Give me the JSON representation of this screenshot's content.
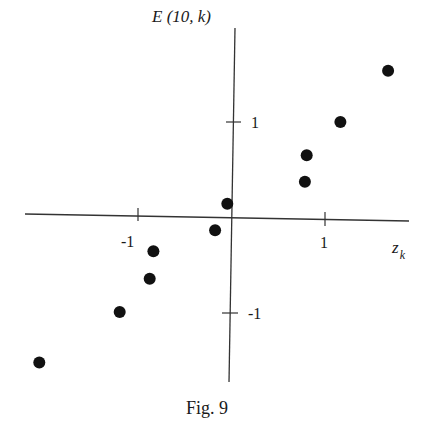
{
  "chart_data": {
    "type": "scatter",
    "title": "",
    "caption": "Fig. 9",
    "xlabel": "z_k",
    "xlabel_main": "z",
    "xlabel_sub": "k",
    "ylabel": "E (10, k)",
    "xticks": [
      {
        "value": -1,
        "label": "-1"
      },
      {
        "value": 1,
        "label": "1"
      }
    ],
    "yticks": [
      {
        "value": 1,
        "label": "1"
      },
      {
        "value": -1,
        "label": "-1"
      }
    ],
    "xlim": [
      -2.2,
      1.9
    ],
    "ylim": [
      -1.75,
      1.99
    ],
    "grid": false,
    "legend": null,
    "series": [
      {
        "name": "E(10,k) vs z_k",
        "points": [
          {
            "x": -2.05,
            "y": -1.53
          },
          {
            "x": -1.19,
            "y": -1.0
          },
          {
            "x": -0.87,
            "y": -0.65
          },
          {
            "x": -0.83,
            "y": -0.36
          },
          {
            "x": -0.17,
            "y": -0.14
          },
          {
            "x": -0.04,
            "y": 0.14
          },
          {
            "x": 0.79,
            "y": 0.37
          },
          {
            "x": 0.81,
            "y": 0.65
          },
          {
            "x": 1.17,
            "y": 1.0
          },
          {
            "x": 1.68,
            "y": 1.54
          }
        ]
      }
    ]
  },
  "labels": {
    "ylabel": "E (10, k)",
    "xlabel_main": "z",
    "xlabel_sub": "k",
    "xtick_neg": "-1",
    "xtick_pos": "1",
    "ytick_pos": "1",
    "ytick_neg": "-1",
    "caption": "Fig. 9"
  },
  "colors": {
    "ink": "#1a1a1a",
    "background": "#ffffff"
  }
}
